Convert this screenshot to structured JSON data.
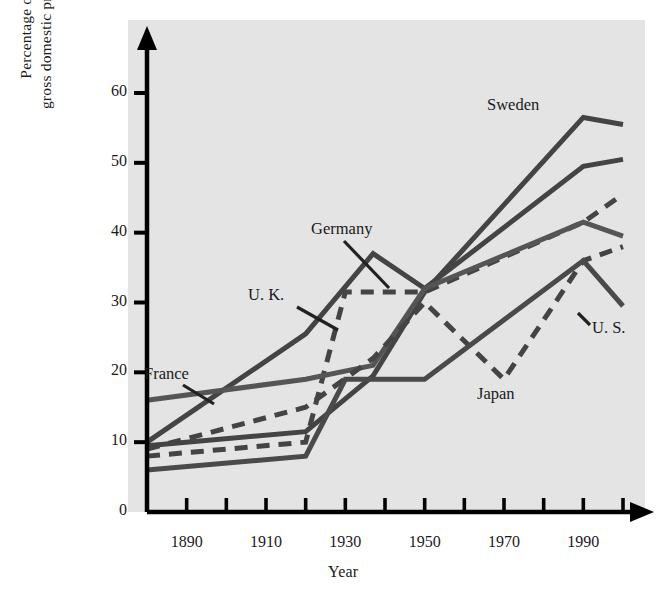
{
  "chart_data": {
    "type": "line",
    "title": "",
    "xlabel": "Year",
    "ylabel": "Percentage of gross domestic product",
    "xlim": [
      1880,
      2000
    ],
    "ylim": [
      0,
      65
    ],
    "yticks": [
      0,
      10,
      20,
      30,
      40,
      50,
      60
    ],
    "xticks": [
      1880,
      1890,
      1900,
      1910,
      1920,
      1930,
      1940,
      1950,
      1960,
      1970,
      1980,
      1990,
      2000
    ],
    "xticklabels": [
      "",
      "1890",
      "",
      "1910",
      "",
      "1930",
      "",
      "1950",
      "",
      "1970",
      "",
      "1990",
      ""
    ],
    "grid": false,
    "legend": "inline-annotations",
    "x": [
      1880,
      1920,
      1930,
      1937,
      1950,
      1970,
      1990,
      2000
    ],
    "series": [
      {
        "name": "Sweden",
        "style": "solid",
        "color": "#444444",
        "width": 5,
        "x": [
          1880,
          1920,
          1937,
          1950,
          1990,
          2000
        ],
        "values": [
          9.5,
          11.5,
          19.5,
          31.5,
          56.5,
          55.5
        ]
      },
      {
        "name": "Germany",
        "style": "solid",
        "color": "#444444",
        "width": 5,
        "x": [
          1880,
          1920,
          1937,
          1950,
          1990,
          2000
        ],
        "values": [
          10.0,
          25.5,
          37.0,
          32.0,
          49.5,
          50.5
        ]
      },
      {
        "name": "U. K.",
        "style": "dashed",
        "color": "#444444",
        "width": 5,
        "x": [
          1880,
          1920,
          1930,
          1950,
          1990,
          2000
        ],
        "values": [
          8.0,
          10.0,
          31.5,
          31.5,
          41.5,
          45.5
        ]
      },
      {
        "name": "France",
        "style": "solid",
        "color": "#555555",
        "width": 5,
        "x": [
          1880,
          1920,
          1937,
          1950,
          1990,
          2000
        ],
        "values": [
          16.0,
          19.0,
          21.0,
          32.0,
          41.5,
          39.5
        ]
      },
      {
        "name": "Japan",
        "style": "dashed",
        "color": "#444444",
        "width": 5,
        "x": [
          1880,
          1920,
          1937,
          1950,
          1970,
          1990,
          2000
        ],
        "values": [
          9.0,
          15.0,
          22.0,
          30.0,
          19.0,
          36.0,
          38.0
        ]
      },
      {
        "name": "U. S.",
        "style": "solid",
        "color": "#4a4a4a",
        "width": 5,
        "x": [
          1880,
          1920,
          1930,
          1950,
          1990,
          2000
        ],
        "values": [
          6.0,
          8.0,
          19.0,
          19.0,
          36.0,
          29.5
        ]
      }
    ],
    "annotations": [
      {
        "label": "Sweden",
        "x": 487,
        "y": 95
      },
      {
        "label": "Germany",
        "x": 311,
        "y": 219
      },
      {
        "label": "U. K.",
        "x": 248,
        "y": 285
      },
      {
        "label": "France",
        "x": 144,
        "y": 364
      },
      {
        "label": "Japan",
        "x": 477,
        "y": 384
      },
      {
        "label": "U. S.",
        "x": 592,
        "y": 318
      }
    ]
  },
  "axes": {
    "ylabel_line1": "Percentage of",
    "ylabel_line2": "gross domestic product",
    "ylabel": "Percentage of gross domestic product",
    "xlabel": "Year",
    "yticks": [
      "60",
      "50",
      "40",
      "30",
      "20",
      "10",
      "0"
    ],
    "xticklabels": [
      "1890",
      "1910",
      "1930",
      "1950",
      "1970",
      "1990"
    ]
  },
  "labels": {
    "sweden": "Sweden",
    "germany": "Germany",
    "uk": "U. K.",
    "france": "France",
    "japan": "Japan",
    "us": "U. S."
  },
  "colors": {
    "plot_background": "#e4e4e4",
    "page_background": "#ffffff",
    "axis": "#000000",
    "line_dark": "#3a3a3a",
    "line_gray": "#555555"
  }
}
